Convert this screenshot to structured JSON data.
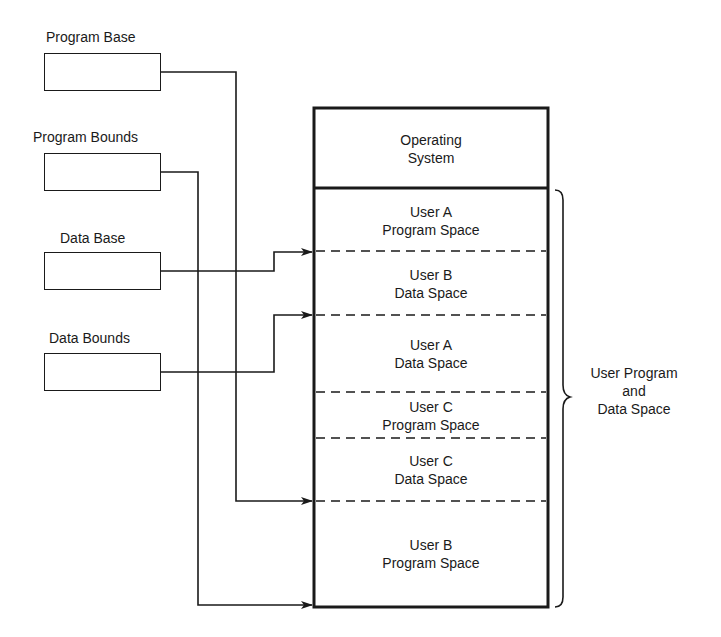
{
  "registers": [
    {
      "label": "Program Base"
    },
    {
      "label": "Program Bounds"
    },
    {
      "label": "Data Base"
    },
    {
      "label": "Data Bounds"
    }
  ],
  "memory": {
    "os": {
      "line1": "Operating",
      "line2": "System"
    },
    "segments": [
      {
        "line1": "User A",
        "line2": "Program Space"
      },
      {
        "line1": "User B",
        "line2": "Data Space"
      },
      {
        "line1": "User A",
        "line2": "Data Space"
      },
      {
        "line1": "User C",
        "line2": "Program Space"
      },
      {
        "line1": "User C",
        "line2": "Data Space"
      },
      {
        "line1": "User B",
        "line2": "Program Space"
      }
    ]
  },
  "brace_label": {
    "line1": "User Program",
    "line2": "and",
    "line3": "Data Space"
  },
  "connections": [
    {
      "from": "Program Base",
      "to": "top of User B Program Space"
    },
    {
      "from": "Program Bounds",
      "to": "bottom of User B Program Space"
    },
    {
      "from": "Data Base",
      "to": "top of User B Data Space"
    },
    {
      "from": "Data Bounds",
      "to": "top of User A Data Space"
    }
  ]
}
